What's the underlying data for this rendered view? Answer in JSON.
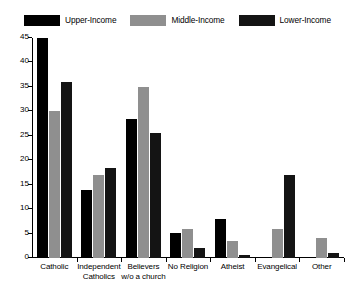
{
  "chart_data": {
    "type": "bar",
    "title": "",
    "subtitle": "",
    "xlabel": "",
    "ylabel": "",
    "ylim": [
      0,
      45
    ],
    "ytick_labels": [
      "0",
      "5",
      "10",
      "15",
      "20",
      "25",
      "30",
      "35",
      "40",
      "45"
    ],
    "ytick_values": [
      0,
      5,
      10,
      15,
      20,
      25,
      30,
      35,
      40,
      45
    ],
    "grid": false,
    "legend_position": "top",
    "categories": [
      "Catholic",
      "Independent Catholics",
      "Believers w/o a church",
      "No Religion",
      "Atheist",
      "Evangelical",
      "Other"
    ],
    "category_lines": [
      [
        "Catholic"
      ],
      [
        "Independent",
        "Catholics"
      ],
      [
        "Believers",
        "w/o a church"
      ],
      [
        "No Religion"
      ],
      [
        "Atheist"
      ],
      [
        "Evangelical"
      ],
      [
        "Other"
      ]
    ],
    "series": [
      {
        "name": "Upper-Income",
        "color": "#000000",
        "values": [
          45,
          14,
          28.5,
          5.2,
          8,
          0,
          0
        ]
      },
      {
        "name": "Middle-Income",
        "color": "#8f8f8f",
        "values": [
          30,
          17,
          35,
          6,
          3.5,
          6,
          4
        ]
      },
      {
        "name": "Lower-Income",
        "color": "#141414",
        "values": [
          36,
          18.5,
          25.5,
          2,
          0.7,
          17,
          1
        ]
      }
    ]
  },
  "legend": {
    "items": [
      {
        "label": "Upper-Income",
        "color": "#000000"
      },
      {
        "label": "Middle-Income",
        "color": "#8f8f8f"
      },
      {
        "label": "Lower-Income",
        "color": "#141414"
      }
    ]
  },
  "colors": {
    "axis": "#000000",
    "background": "#ffffff",
    "upper_income": "#000000",
    "middle_income": "#8f8f8f",
    "lower_income": "#141414"
  }
}
